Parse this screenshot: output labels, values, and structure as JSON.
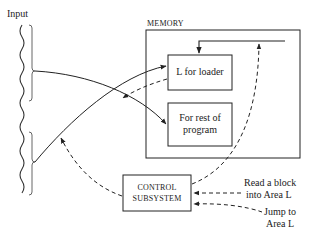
{
  "diagram": {
    "input_label": "Input",
    "memory": {
      "title": "MEMORY",
      "loader_box": "L for loader",
      "program_box_line1": "For rest of",
      "program_box_line2": "program"
    },
    "control": {
      "line1": "CONTROL",
      "line2": "SUBSYSTEM"
    },
    "signals": {
      "read_line1": "Read a block",
      "read_line2": "into Area L",
      "jump_line1": "Jump to",
      "jump_line2": "Area L"
    },
    "colors": {
      "stroke": "#222222",
      "background": "#ffffff"
    }
  }
}
